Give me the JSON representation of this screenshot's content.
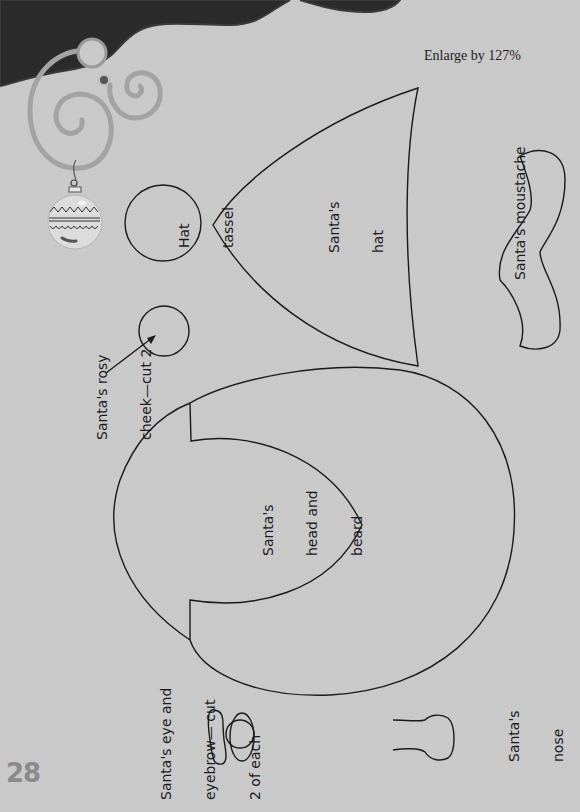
{
  "page": {
    "instruction": "Enlarge by 127%",
    "page_number": "28",
    "colors": {
      "background": "#c9c9c9",
      "dark_shape": "#2b2b2b",
      "outline": "#1a1a1a",
      "swirl": "#a0a0a0"
    }
  },
  "pieces": {
    "hat_tassel": {
      "line1": "Hat",
      "line2": "tassel"
    },
    "hat": {
      "line1": "Santa's",
      "line2": "hat"
    },
    "moustache": {
      "line1": "Santa's moustache"
    },
    "cheek": {
      "line1": "Santa's rosy",
      "line2": "cheek—cut 2"
    },
    "head_beard": {
      "line1": "Santa's",
      "line2": "head and",
      "line3": "beard"
    },
    "eye_eyebrow": {
      "line1": "Santa's eye and",
      "line2": "eyebrow— cut",
      "line3": "2 of each"
    },
    "nose": {
      "line1": "Santa's",
      "line2": "nose"
    }
  },
  "decorations": {
    "top_blob": "dark-wave-shape",
    "swirls": "spiral-ornament",
    "ornament": "christmas-bauble-icon"
  }
}
